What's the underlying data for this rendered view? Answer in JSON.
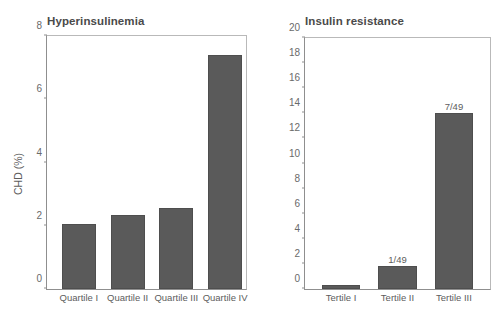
{
  "chart_data": [
    {
      "type": "bar",
      "panel_id": "hyperinsulinemia",
      "title": "Hyperinsulinemia",
      "xlabel": "",
      "ylabel": "CHD (%)",
      "ylim": [
        0,
        8
      ],
      "yticks": [
        0,
        2,
        4,
        6,
        8
      ],
      "ytick_labels": [
        "0",
        "2",
        "4",
        "6",
        "8"
      ],
      "grid": false,
      "legend": "none",
      "categories": [
        "Quartile I",
        "Quartile II",
        "Quartile III",
        "Quartile IV"
      ],
      "values": [
        2.05,
        2.35,
        2.55,
        7.4
      ],
      "point_labels": [
        "",
        "",
        "",
        ""
      ],
      "bar_color": "#5a5a5a"
    },
    {
      "type": "bar",
      "panel_id": "insulin-resistance",
      "title": "Insulin resistance",
      "xlabel": "",
      "ylabel": "",
      "ylim": [
        0,
        20
      ],
      "yticks": [
        0,
        2,
        4,
        6,
        8,
        10,
        12,
        14,
        16,
        18,
        20
      ],
      "ytick_labels": [
        "0",
        "2",
        "4",
        "6",
        "8",
        "10",
        "12",
        "14",
        "16",
        "18",
        "20"
      ],
      "grid": false,
      "legend": "none",
      "categories": [
        "Tertile I",
        "Tertile II",
        "Tertile III"
      ],
      "values": [
        0.3,
        1.8,
        14.0
      ],
      "point_labels": [
        "",
        "1/49",
        "7/49"
      ],
      "bar_color": "#5a5a5a"
    }
  ],
  "colors": {
    "bar": "#5a5a5a",
    "axis": "#8f8f8f",
    "frame": "#b9b9b9",
    "text": "#5d5d5d",
    "title": "#4a4a4a",
    "background": "#ffffff"
  }
}
